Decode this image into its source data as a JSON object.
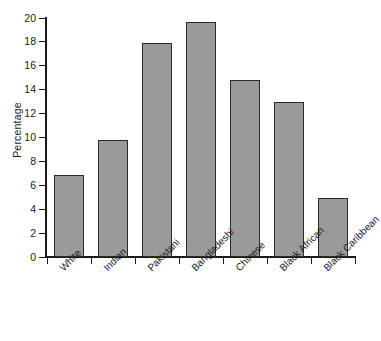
{
  "chart_data": {
    "type": "bar",
    "title": "",
    "xlabel": "",
    "ylabel": "Percentage",
    "categories": [
      "White",
      "Indian",
      "Pakistani",
      "Bangladeshi",
      "Chinese",
      "Black African",
      "Black Caribbean"
    ],
    "values": [
      6.9,
      9.8,
      17.9,
      19.7,
      14.8,
      13.0,
      4.9
    ],
    "ylim": [
      0,
      20
    ],
    "ytick_labels": [
      "0",
      "2",
      "4",
      "6",
      "8",
      "10",
      "12",
      "14",
      "16",
      "18",
      "20"
    ],
    "ytick_values": [
      0,
      2,
      4,
      6,
      8,
      10,
      12,
      14,
      16,
      18,
      20
    ],
    "grid": false,
    "legend": false,
    "legend_position": "none",
    "bar_fill_color": "#9a9a9a",
    "bar_border_color": "#2b2b2b",
    "axis_color": "#1a1a1a",
    "background_color": "#ffffff",
    "xtick_label_rotation": -45
  }
}
